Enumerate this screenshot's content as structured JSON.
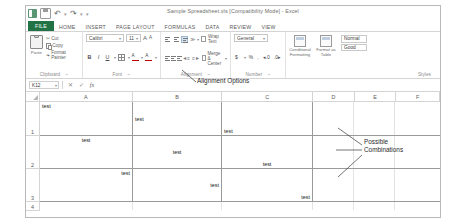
{
  "window": {
    "document_title": "Sample Spreadsheet.xls  [Compatibility Mode]  -  Excel",
    "app_name": "Excel"
  },
  "quick_access": {
    "items": [
      {
        "name": "excel-logo",
        "label": ""
      },
      {
        "name": "save",
        "label": ""
      },
      {
        "name": "undo",
        "label": "↶"
      },
      {
        "name": "redo",
        "label": "↷"
      },
      {
        "name": "customize",
        "label": "▾"
      }
    ]
  },
  "ribbon_tabs": [
    {
      "label": "FILE",
      "active": true
    },
    {
      "label": "HOME",
      "active": false
    },
    {
      "label": "INSERT",
      "active": false
    },
    {
      "label": "PAGE LAYOUT",
      "active": false
    },
    {
      "label": "FORMULAS",
      "active": false
    },
    {
      "label": "DATA",
      "active": false
    },
    {
      "label": "REVIEW",
      "active": false
    },
    {
      "label": "VIEW",
      "active": false
    }
  ],
  "ribbon": {
    "clipboard": {
      "group_label": "Clipboard",
      "dialog_launcher": "⌐",
      "paste_label": "Paste",
      "cut_label": "Cut",
      "copy_label": "Copy",
      "format_painter_label": "Format Painter"
    },
    "font": {
      "group_label": "Font",
      "dialog_launcher": "⌐",
      "font_name": "Calibri",
      "font_size": "11",
      "grow_font": "A",
      "shrink_font": "A",
      "bold": "B",
      "italic": "I",
      "underline": "U",
      "borders": "",
      "fill_color": "",
      "font_color": ""
    },
    "alignment": {
      "group_label": "Alignment",
      "dialog_launcher": "⌐",
      "wrap_text_label": "Wrap Text",
      "merge_center_label": "Merge & Center",
      "orientation": "≫",
      "decrease_indent": "◄≡",
      "increase_indent": "≡►"
    },
    "number": {
      "group_label": "Number",
      "dialog_launcher": "⌐",
      "format_value": "General",
      "currency": "$",
      "percent": "%",
      "comma": ",",
      "increase_decimal": "◂.0",
      "decrease_decimal": ".0▸"
    },
    "styles": {
      "group_label": "Styles",
      "conditional_formatting_label": "Conditional Formatting",
      "format_as_table_label": "Format as Table",
      "cell_style_normal": "Normal",
      "cell_style_good": "Good"
    }
  },
  "formula_bar": {
    "name_box_value": "K12",
    "name_box_caret": "▾",
    "cancel": "✕",
    "enter": "✓",
    "insert_function": "fx",
    "formula_value": ""
  },
  "sheet": {
    "columns": [
      "A",
      "B",
      "C",
      "D",
      "E",
      "F"
    ],
    "rows": [
      "1",
      "2",
      "3",
      "4"
    ],
    "cell_text": "test",
    "grid": [
      {
        "row": "1",
        "cells": [
          {
            "col": "A",
            "text": "test",
            "halign": "left",
            "valign": "top"
          },
          {
            "col": "B",
            "text": "test",
            "halign": "left",
            "valign": "middle"
          },
          {
            "col": "C",
            "text": "test",
            "halign": "left",
            "valign": "bottom"
          }
        ]
      },
      {
        "row": "2",
        "cells": [
          {
            "col": "A",
            "text": "test",
            "halign": "center",
            "valign": "top"
          },
          {
            "col": "B",
            "text": "test",
            "halign": "center",
            "valign": "middle"
          },
          {
            "col": "C",
            "text": "test",
            "halign": "center",
            "valign": "bottom"
          }
        ]
      },
      {
        "row": "3",
        "cells": [
          {
            "col": "A",
            "text": "test",
            "halign": "right",
            "valign": "top"
          },
          {
            "col": "B",
            "text": "test",
            "halign": "right",
            "valign": "middle"
          },
          {
            "col": "C",
            "text": "test",
            "halign": "right",
            "valign": "bottom"
          }
        ]
      }
    ]
  },
  "annotations": {
    "alignment_options": {
      "line1": "Alignment Options"
    },
    "possible_combinations": {
      "line1": "Possible",
      "line2": "Combinations"
    }
  }
}
